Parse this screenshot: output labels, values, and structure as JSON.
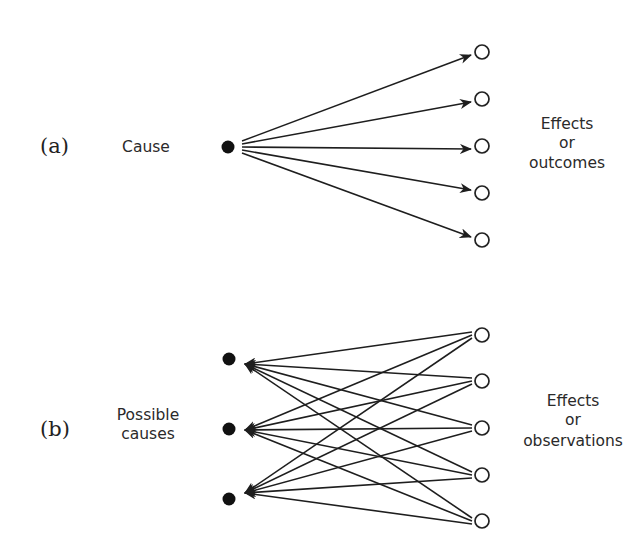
{
  "panels": {
    "a": {
      "label": "(a)",
      "left_label": "Cause",
      "right_label_lines": [
        "Effects",
        "or",
        "outcomes"
      ],
      "direction": "cause-to-effects",
      "causes": [
        {
          "x": 228,
          "y": 147
        }
      ],
      "effects": [
        {
          "x": 482,
          "y": 52
        },
        {
          "x": 482,
          "y": 99
        },
        {
          "x": 482,
          "y": 146
        },
        {
          "x": 482,
          "y": 193
        },
        {
          "x": 482,
          "y": 240
        }
      ]
    },
    "b": {
      "label": "(b)",
      "left_label_lines": [
        "Possible",
        "causes"
      ],
      "right_label_lines": [
        "Effects",
        "or",
        "observations"
      ],
      "direction": "effects-to-causes",
      "causes": [
        {
          "x": 229,
          "y": 359
        },
        {
          "x": 229,
          "y": 429
        },
        {
          "x": 229,
          "y": 499
        }
      ],
      "effects": [
        {
          "x": 482,
          "y": 335
        },
        {
          "x": 482,
          "y": 381
        },
        {
          "x": 482,
          "y": 428
        },
        {
          "x": 482,
          "y": 475
        },
        {
          "x": 482,
          "y": 521
        }
      ]
    }
  },
  "colors": {
    "stroke": "#1e1e1e",
    "filled_node": "#111111",
    "text": "#2a2a2a"
  }
}
